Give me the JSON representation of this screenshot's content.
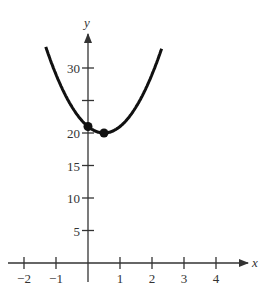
{
  "chart_data": {
    "type": "line",
    "title": "",
    "xlabel": "x",
    "ylabel": "y",
    "xlim": [
      -2.2,
      5
    ],
    "ylim": [
      -3,
      36
    ],
    "x_ticks": [
      -2,
      -1,
      1,
      2,
      3,
      4
    ],
    "x_tick_labels": [
      "−2",
      "−1",
      "1",
      "2",
      "3",
      "4"
    ],
    "y_ticks": [
      5,
      10,
      15,
      20,
      25,
      30
    ],
    "y_tick_labels": [
      "5",
      "10",
      "15",
      "20",
      "",
      "30"
    ],
    "grid": false,
    "series": [
      {
        "name": "parabola",
        "function": "y = 4(x - 0.5)^2 + 20",
        "x": [
          -1.3,
          -1.0,
          -0.5,
          0.0,
          0.5,
          1.0,
          1.5,
          2.0,
          2.3
        ],
        "y": [
          33.0,
          29.0,
          24.0,
          21.0,
          20.0,
          21.0,
          24.0,
          29.0,
          33.0
        ]
      }
    ],
    "points": [
      {
        "x": 0,
        "y": 21,
        "label": "y-intercept"
      },
      {
        "x": 0.5,
        "y": 20,
        "label": "vertex"
      }
    ]
  },
  "colors": {
    "curve": "#111111",
    "axis": "#333333",
    "text": "#333333"
  }
}
